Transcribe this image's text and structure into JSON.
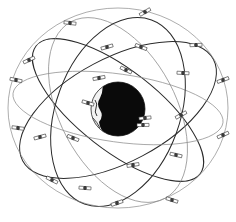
{
  "diagram": {
    "colors": {
      "background": "#ffffff",
      "earth_dark": "#0a0a0a",
      "earth_light": "#f2f2f2",
      "orbit_dark": "#2a2a2a",
      "orbit_light": "#8a8a8a",
      "satellite": "#3a3a3a"
    },
    "earth": {
      "label": "Earth"
    },
    "orbit_count": 6,
    "satellite_count": 25,
    "orbits": [
      {
        "id": "plane-a",
        "shade": "dark"
      },
      {
        "id": "plane-b",
        "shade": "dark"
      },
      {
        "id": "plane-c",
        "shade": "light"
      },
      {
        "id": "plane-d",
        "shade": "light"
      },
      {
        "id": "plane-e",
        "shade": "dark"
      },
      {
        "id": "plane-f",
        "shade": "light"
      }
    ]
  }
}
